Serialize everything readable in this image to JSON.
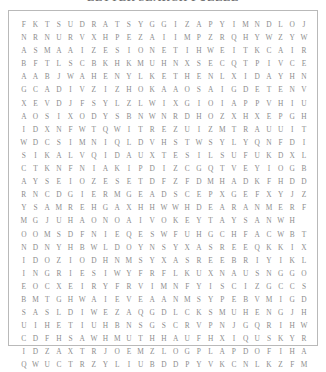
{
  "page": {
    "background_color": "#ffffff",
    "letter_color": "#8d8d8d",
    "border_color": "#b9b9b9"
  },
  "puzzle": {
    "title": "LETTER SEARCH PUZZLE",
    "rows": 25,
    "columns": 25,
    "grid": [
      "FKTSUDRATSYGGIZAPYIMNDLOJ",
      "NRNURVXHPEZAIIMPZRQHYWZYW",
      "ASMAAIZESIONETIHWEITKCAIR",
      "BFTLSCBKHKMUHNXSECQTPIVCE",
      "AABJWAHENYLKETHENLXIDAYHN",
      "GCADIVZIZHOKAAOSAIGDETENV",
      "XEVDJFSYLZLWIXGIOIAPPVHIU",
      "AOSIXODYSBNWNRDHOZXHXEPGH",
      "IDXNFWTQWITREZUIZMTRAUUIT",
      "WDCSIMNIQLDVHSTWSYLYQNFDI",
      "SIKALVQIDAUXTESILSUFUKDXL",
      "CTKNFNIAKIPDIZCGQTVEYIOGB",
      "AYSEIOZESETDFZFDMHADKFHDD",
      "RNCDGIERMGEADSCEPXGEFXYJZW",
      "YSAMREHGAXHHWWHDEARANMERFZ",
      "MGJUHAONOAIVOKEYTAYSANWH",
      "OOMSDFNIEQESWFUHGCHFACWBT",
      "NDNYHBWLDOYNSYXASREEQKKIXD",
      "IDOZIODHNMSYXASREEBRIYIKL",
      "INGRIESIWYFRFLKUXNAUSNGGO",
      "EOCXEIRYFRVIMNFYISCIZGCCS",
      "BMTGHWAIEVEAANMSYPEBVMIGD",
      "SASLDIWEZAQGDLCKSMUHENGJH",
      "UIHETIUHBNSGSCRVPNJGQRIHW",
      "CDFHSAWHMUTHHAUFHXIQUSKYR",
      "IDZAXTRJOEMZLOGPLAPDOFIHA",
      "QWUCTRZYLIUBDDPYVKCNLKZFM"
    ]
  }
}
